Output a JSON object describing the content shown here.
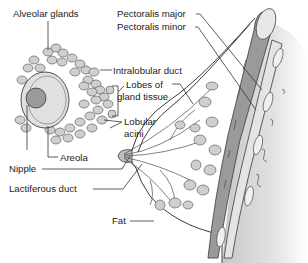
{
  "diagram": {
    "labels": {
      "alveolar_glands": "Alveolar glands",
      "pectoralis_major": "Pectoralis major",
      "pectoralis_minor": "Pectoralis minor",
      "intralobular_duct": "Intralobular duct",
      "lobes_line1": "Lobes of",
      "lobes_line2": "gland tissue",
      "lobular_line1": "Lobular",
      "lobular_line2": "acini",
      "areola": "Areola",
      "nipple": "Nipple",
      "lactiferous_duct": "Lactiferous duct",
      "fat": "Fat"
    },
    "colors": {
      "background": "#ffffff",
      "line": "#333333",
      "gland_fill": "#cfcfcf",
      "muscle_fill": "#9a9a9a",
      "chest_wall_shade": "#d8d8d8"
    }
  }
}
